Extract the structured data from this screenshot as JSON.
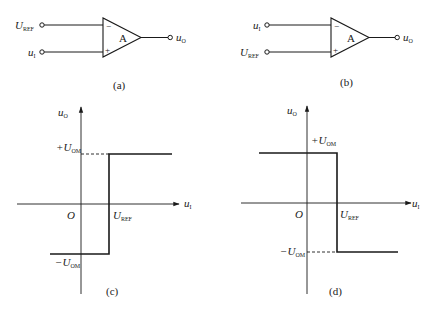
{
  "figure": {
    "panels": {
      "a": {
        "caption": "(a)",
        "inverting_input": {
          "label_main": "U",
          "label_sub": "REF"
        },
        "noninverting_input": {
          "label_main": "u",
          "label_sub": "I"
        },
        "amp_label": "A",
        "minus_sign": "−",
        "plus_sign": "+",
        "output": {
          "label_main": "u",
          "label_sub": "O"
        }
      },
      "b": {
        "caption": "(b)",
        "inverting_input": {
          "label_main": "u",
          "label_sub": "I"
        },
        "noninverting_input": {
          "label_main": "U",
          "label_sub": "REF"
        },
        "amp_label": "A",
        "minus_sign": "−",
        "plus_sign": "+",
        "output": {
          "label_main": "u",
          "label_sub": "O"
        }
      },
      "c": {
        "caption": "(c)",
        "y_axis": {
          "label_main": "u",
          "label_sub": "O"
        },
        "x_axis": {
          "label_main": "u",
          "label_sub": "I"
        },
        "origin": "O",
        "pos_level": {
          "label_main": "+U",
          "label_sub": "OM"
        },
        "neg_level": {
          "label_main": "−U",
          "label_sub": "OM"
        },
        "threshold": {
          "label_main": "U",
          "label_sub": "REF"
        }
      },
      "d": {
        "caption": "(d)",
        "y_axis": {
          "label_main": "u",
          "label_sub": "O"
        },
        "x_axis": {
          "label_main": "u",
          "label_sub": "I"
        },
        "origin": "O",
        "pos_level": {
          "label_main": "+U",
          "label_sub": "OM"
        },
        "neg_level": {
          "label_main": "−U",
          "label_sub": "OM"
        },
        "threshold": {
          "label_main": "U",
          "label_sub": "REF"
        }
      }
    },
    "colors": {
      "stroke": "#1a1a1a",
      "background": "#ffffff"
    }
  }
}
